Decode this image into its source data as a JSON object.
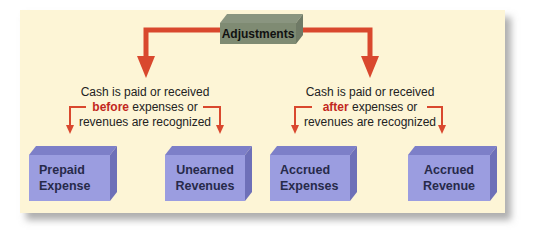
{
  "diagram": {
    "root": {
      "label": "Adjustments"
    },
    "groups": [
      {
        "caption": {
          "line1": "Cash is paid or received",
          "emphasis": "before",
          "line2_rest": " expenses or",
          "line3": "revenues are recognized"
        },
        "children": [
          {
            "line1": "Prepaid",
            "line2": "Expense"
          },
          {
            "line1": "Unearned",
            "line2": "Revenues"
          }
        ]
      },
      {
        "caption": {
          "line1": "Cash is paid or received",
          "emphasis": "after",
          "line2_rest": " expenses or",
          "line3": "revenues are recognized"
        },
        "children": [
          {
            "line1": "Accrued",
            "line2": "Expenses"
          },
          {
            "line1": "Accrued",
            "line2": "Revenue"
          }
        ]
      }
    ],
    "colors": {
      "background": "#fdf5d6",
      "arrow": "#d9482e",
      "emphasis_text": "#c2281e",
      "root_box": "#7f8b73",
      "child_box": "#9b9de0"
    }
  }
}
